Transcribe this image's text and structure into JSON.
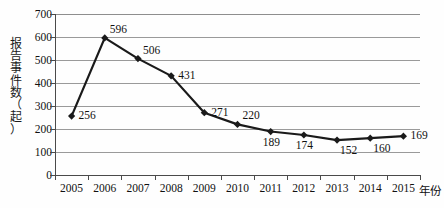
{
  "chart_data": {
    "type": "line",
    "title": "",
    "subtitle": "",
    "xlabel": "年份",
    "ylabel": "报告事件数（起）",
    "ylabel_chars": [
      "报",
      "告",
      "事",
      "件",
      "数",
      "（",
      "起",
      "）"
    ],
    "categories": [
      "2005",
      "2006",
      "2007",
      "2008",
      "2009",
      "2010",
      "2011",
      "2012",
      "2013",
      "2014",
      "2015"
    ],
    "values": [
      256,
      596,
      506,
      431,
      271,
      220,
      189,
      174,
      152,
      160,
      169
    ],
    "series": [
      {
        "name": "报告事件数",
        "values": [
          256,
          596,
          506,
          431,
          271,
          220,
          189,
          174,
          152,
          160,
          169
        ]
      }
    ],
    "ylim": [
      0,
      700
    ],
    "ytick_values": [
      "0",
      "100",
      "200",
      "300",
      "400",
      "500",
      "600",
      "700"
    ],
    "ytick_step": 100,
    "grid": true,
    "grid_axis": "y",
    "legend": false,
    "legend_position": "none",
    "marker": "diamond",
    "line_color": "#1a1a1a",
    "marker_color": "#1a1a1a",
    "grid_color": "#9a9a9a",
    "axis_color": "#4a4a4a",
    "background": "#fefefe",
    "data_labels": [
      {
        "category": "2005",
        "value": 256,
        "text": "256",
        "placement": "right"
      },
      {
        "category": "2006",
        "value": 596,
        "text": "596",
        "placement": "above-right"
      },
      {
        "category": "2007",
        "value": 506,
        "text": "506",
        "placement": "above-right"
      },
      {
        "category": "2008",
        "value": 431,
        "text": "431",
        "placement": "right"
      },
      {
        "category": "2009",
        "value": 271,
        "text": "271",
        "placement": "right"
      },
      {
        "category": "2010",
        "value": 220,
        "text": "220",
        "placement": "above-right"
      },
      {
        "category": "2011",
        "value": 189,
        "text": "189",
        "placement": "below"
      },
      {
        "category": "2012",
        "value": 174,
        "text": "174",
        "placement": "below"
      },
      {
        "category": "2013",
        "value": 152,
        "text": "152",
        "placement": "below-right"
      },
      {
        "category": "2014",
        "value": 160,
        "text": "160",
        "placement": "below-right"
      },
      {
        "category": "2015",
        "value": 169,
        "text": "169",
        "placement": "right"
      }
    ]
  }
}
